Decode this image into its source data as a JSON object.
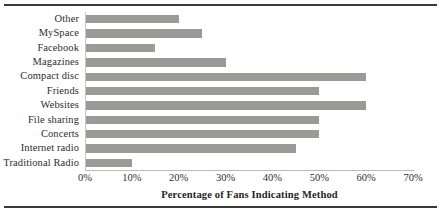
{
  "chart_data": {
    "type": "bar",
    "orientation": "horizontal",
    "title": "",
    "xlabel": "Percentage of Fans Indicating Method",
    "ylabel": "",
    "xlim": [
      0,
      70
    ],
    "xtick_labels": [
      "0%",
      "10%",
      "20%",
      "30%",
      "40%",
      "50%",
      "60%",
      "70%"
    ],
    "xtick_values": [
      0,
      10,
      20,
      30,
      40,
      50,
      60,
      70
    ],
    "grid": false,
    "legend": null,
    "bar_color": "#9c9a96",
    "categories": [
      "Other",
      "MySpace",
      "Facebook",
      "Magazines",
      "Compact disc",
      "Friends",
      "Websites",
      "File sharing",
      "Concerts",
      "Internet radio",
      "Traditional Radio"
    ],
    "values": [
      20,
      25,
      15,
      30,
      60,
      50,
      60,
      50,
      50,
      45,
      10
    ],
    "value_unit": "%"
  },
  "figure": {
    "rule_color": "#3a3a3a"
  }
}
